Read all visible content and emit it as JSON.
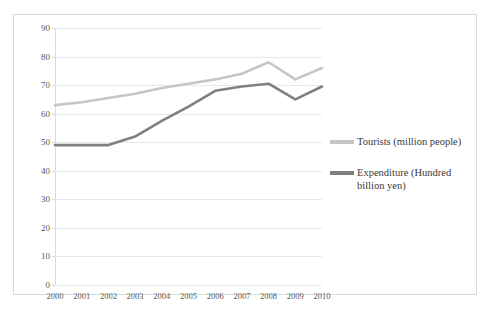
{
  "chart_data": {
    "type": "line",
    "title": "",
    "xlabel": "",
    "ylabel": "",
    "categories": [
      "2000",
      "2001",
      "2002",
      "2003",
      "2004",
      "2005",
      "2006",
      "2007",
      "2008",
      "2009",
      "2010"
    ],
    "ylim": [
      0,
      90
    ],
    "yticks": [
      0,
      10,
      20,
      30,
      40,
      50,
      60,
      70,
      80,
      90
    ],
    "ytick_labels": [
      "0",
      "10",
      "20",
      "30",
      "40",
      "50",
      "60",
      "70",
      "80",
      "90"
    ],
    "grid": true,
    "legend_position": "right",
    "series": [
      {
        "name": "Tourists (million people)",
        "color": "#c6c6c6",
        "values": [
          63,
          64,
          65.5,
          67,
          69,
          70.5,
          72,
          74,
          78,
          72,
          76
        ]
      },
      {
        "name": "Expenditure (Hundred billion yen)",
        "color": "#808080",
        "values": [
          49,
          49,
          49,
          52,
          57.5,
          62.5,
          68,
          69.5,
          70.5,
          65,
          69.5
        ]
      }
    ]
  },
  "legend": {
    "items": [
      {
        "label": "Tourists (million people)",
        "color": "#c6c6c6"
      },
      {
        "label": "Expenditure (Hundred billion yen)",
        "color": "#808080"
      }
    ]
  }
}
